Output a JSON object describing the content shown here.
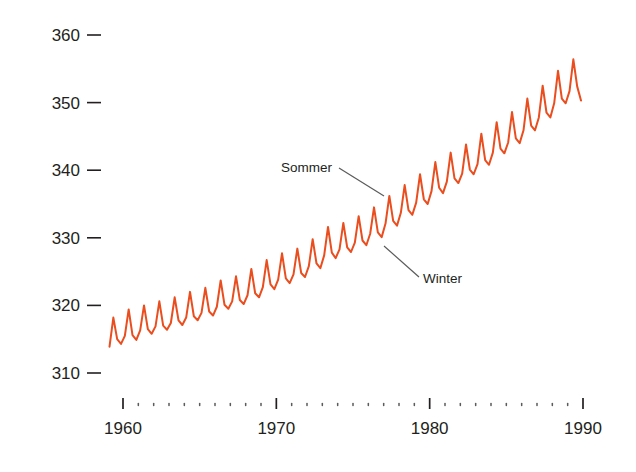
{
  "chart_data": {
    "type": "line",
    "title": "",
    "subtitle": "",
    "xlabel": "",
    "ylabel": "",
    "xlim": [
      1958.0,
      1990.0
    ],
    "ylim": [
      305.0,
      362.0
    ],
    "grid": false,
    "legend": "none",
    "line_color": "#EA4D1E",
    "xticks": [
      1960,
      1970,
      1980,
      1990
    ],
    "xtick_labels": [
      "1960",
      "1970",
      "1980",
      "1990"
    ],
    "xminor_step": 1,
    "yticks": [
      310,
      320,
      330,
      340,
      350,
      360
    ],
    "ytick_labels": [
      "310",
      "320",
      "330",
      "340",
      "350",
      "360"
    ],
    "annotations": [
      {
        "name": "sommer",
        "label": "Sommer",
        "text_x": 332,
        "text_y": 172,
        "anchor": "end",
        "leader_from": [
          339,
          168
        ],
        "leader_to": [
          384,
          196
        ]
      },
      {
        "name": "winter",
        "label": "Winter",
        "text_x": 423,
        "text_y": 283,
        "anchor": "start",
        "leader_from": [
          384,
          246
        ],
        "leader_to": [
          419,
          277
        ]
      }
    ],
    "series": [
      {
        "name": "CO2",
        "x": [
          1959.12,
          1959.37,
          1959.62,
          1959.87,
          1960.12,
          1960.37,
          1960.62,
          1960.87,
          1961.12,
          1961.37,
          1961.62,
          1961.87,
          1962.12,
          1962.37,
          1962.62,
          1962.87,
          1963.12,
          1963.37,
          1963.62,
          1963.87,
          1964.12,
          1964.37,
          1964.62,
          1964.87,
          1965.12,
          1965.37,
          1965.62,
          1965.87,
          1966.12,
          1966.37,
          1966.62,
          1966.87,
          1967.12,
          1967.37,
          1967.62,
          1967.87,
          1968.12,
          1968.37,
          1968.62,
          1968.87,
          1969.12,
          1969.37,
          1969.62,
          1969.87,
          1970.12,
          1970.37,
          1970.62,
          1970.87,
          1971.12,
          1971.37,
          1971.62,
          1971.87,
          1972.12,
          1972.37,
          1972.62,
          1972.87,
          1973.12,
          1973.37,
          1973.62,
          1973.87,
          1974.12,
          1974.37,
          1974.62,
          1974.87,
          1975.12,
          1975.37,
          1975.62,
          1975.87,
          1976.12,
          1976.37,
          1976.62,
          1976.87,
          1977.12,
          1977.37,
          1977.62,
          1977.87,
          1978.12,
          1978.37,
          1978.62,
          1978.87,
          1979.12,
          1979.37,
          1979.62,
          1979.87,
          1980.12,
          1980.37,
          1980.62,
          1980.87,
          1981.12,
          1981.37,
          1981.62,
          1981.87,
          1982.12,
          1982.37,
          1982.62,
          1982.87,
          1983.12,
          1983.37,
          1983.62,
          1983.87,
          1984.12,
          1984.37,
          1984.62,
          1984.87,
          1985.12,
          1985.37,
          1985.62,
          1985.87,
          1986.12,
          1986.37,
          1986.62,
          1986.87,
          1987.12,
          1987.37,
          1987.62,
          1987.87,
          1988.12,
          1988.37,
          1988.62,
          1988.87,
          1989.12,
          1989.37,
          1989.62,
          1989.87
        ],
        "y": [
          313.9,
          318.2,
          315.0,
          314.3,
          315.5,
          319.4,
          315.6,
          314.9,
          316.3,
          320.0,
          316.5,
          315.8,
          316.9,
          320.6,
          317.0,
          316.4,
          317.4,
          321.2,
          317.8,
          317.1,
          318.2,
          322.0,
          318.4,
          317.8,
          318.9,
          322.6,
          319.1,
          318.5,
          319.8,
          323.7,
          320.1,
          319.5,
          320.6,
          324.3,
          320.8,
          320.2,
          321.5,
          325.4,
          321.8,
          321.2,
          322.7,
          326.7,
          323.1,
          322.4,
          323.8,
          327.7,
          324.0,
          323.3,
          324.6,
          328.4,
          324.8,
          324.2,
          325.8,
          329.8,
          326.2,
          325.5,
          327.4,
          331.6,
          327.8,
          327.0,
          328.3,
          332.2,
          328.6,
          327.9,
          329.3,
          333.2,
          329.6,
          328.9,
          330.6,
          334.5,
          330.8,
          330.1,
          332.1,
          336.2,
          332.5,
          331.8,
          333.7,
          337.8,
          334.1,
          333.4,
          335.2,
          339.4,
          335.7,
          335.0,
          336.9,
          341.2,
          337.4,
          336.6,
          338.3,
          342.6,
          338.8,
          338.1,
          339.5,
          343.8,
          340.1,
          339.4,
          340.9,
          345.4,
          341.5,
          340.8,
          342.6,
          347.1,
          343.2,
          342.5,
          344.1,
          348.6,
          344.7,
          344.0,
          345.9,
          350.6,
          346.6,
          345.9,
          347.8,
          352.5,
          348.5,
          347.8,
          349.9,
          354.7,
          350.6,
          349.9,
          351.7,
          356.4,
          352.4,
          350.3
        ]
      }
    ]
  },
  "axes": {
    "x_axis_name": "year-axis",
    "y_axis_name": "co2-axis"
  }
}
